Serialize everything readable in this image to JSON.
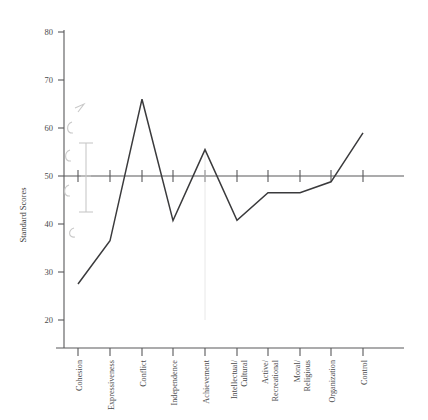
{
  "chart_data": {
    "type": "line",
    "title": "",
    "subtitle": "",
    "xlabel": "",
    "ylabel": "Standard Scores",
    "ylim": [
      20,
      80
    ],
    "ytick_values": [
      20,
      30,
      40,
      50,
      60,
      70,
      80
    ],
    "ytick_labels": [
      "20",
      "30",
      "40",
      "50",
      "60",
      "70",
      "80"
    ],
    "grid": false,
    "legend": false,
    "legend_position": "none",
    "reference_line": {
      "value": 50,
      "label": ""
    },
    "categories": [
      "Cohesion",
      "Expressiveness",
      "Conflict",
      "Independence",
      "Achievement",
      "Intellectual/\nCultural",
      "Active/\nRecreational",
      "Moral/\nReligious",
      "Organization",
      "Control"
    ],
    "category_labels": [
      [
        "Cohesion"
      ],
      [
        "Expressiveness"
      ],
      [
        "Conflict"
      ],
      [
        "Independence"
      ],
      [
        "Achievement"
      ],
      [
        "Intellectual/",
        "Cultural"
      ],
      [
        "Active/",
        "Recreational"
      ],
      [
        "Moral/",
        "Religious"
      ],
      [
        "Organization"
      ],
      [
        "Control"
      ]
    ],
    "series": [
      {
        "name": "Standard Score",
        "color": "#3a3a3c",
        "values": [
          27.5,
          36.5,
          66,
          40.7,
          55.5,
          40.8,
          46.5,
          46.5,
          48.8,
          59
        ]
      }
    ]
  },
  "annotation": {
    "type": "handwritten-pencil-mark",
    "text": "",
    "color": "#cfcfcf"
  },
  "axis": {
    "y_title": "Standard Scores"
  }
}
